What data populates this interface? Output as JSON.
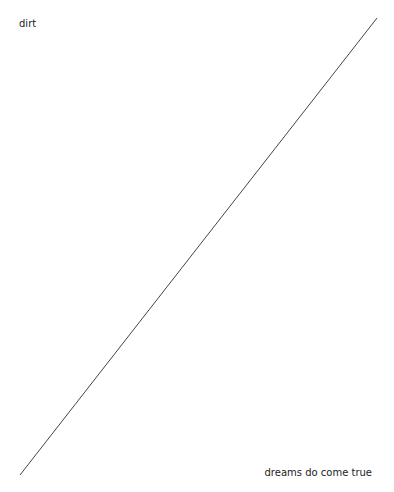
{
  "labels": {
    "top_left": "dirt",
    "bottom_right": "dreams do come true"
  },
  "line": {
    "x1": 20,
    "y1": 475,
    "x2": 377,
    "y2": 18,
    "color": "#444444"
  }
}
